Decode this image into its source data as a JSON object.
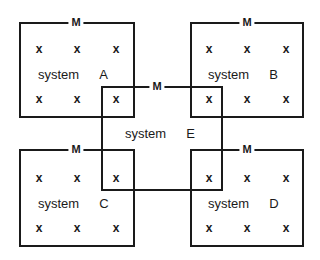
{
  "diagram": {
    "boundary_label": "M",
    "particle_symbol": "x",
    "systems": [
      {
        "id": "A",
        "label": "system",
        "letter": "A",
        "boundary": "M",
        "particles": 6
      },
      {
        "id": "B",
        "label": "system",
        "letter": "B",
        "boundary": "M",
        "particles": 6
      },
      {
        "id": "C",
        "label": "system",
        "letter": "C",
        "boundary": "M",
        "particles": 6
      },
      {
        "id": "D",
        "label": "system",
        "letter": "D",
        "boundary": "M",
        "particles": 6
      },
      {
        "id": "E",
        "label": "system",
        "letter": "E",
        "boundary": "M",
        "particles": 4
      }
    ],
    "colors": {
      "line": "#1a1a1a",
      "background": "#ffffff"
    }
  }
}
